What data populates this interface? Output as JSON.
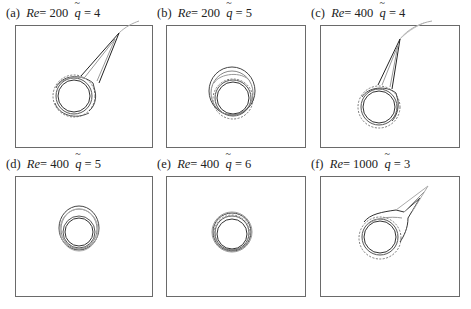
{
  "figure": {
    "panels": [
      {
        "id": "a",
        "label": "(a)",
        "re_symbol": "Re",
        "re_eq": "= 200",
        "q_symbol": "q",
        "q_eq": "= 4",
        "shape": "circle-with-long-tail"
      },
      {
        "id": "b",
        "label": "(b)",
        "re_symbol": "Re",
        "re_eq": "= 200",
        "q_symbol": "q",
        "q_eq": "= 5",
        "shape": "circle-with-upper-bulge"
      },
      {
        "id": "c",
        "label": "(c)",
        "re_symbol": "Re",
        "re_eq": "= 400",
        "q_symbol": "q",
        "q_eq": "= 4",
        "shape": "circle-with-long-tail"
      },
      {
        "id": "d",
        "label": "(d)",
        "re_symbol": "Re",
        "re_eq": "= 400",
        "q_symbol": "q",
        "q_eq": "= 5",
        "shape": "circle-with-small-bulge"
      },
      {
        "id": "e",
        "label": "(e)",
        "re_symbol": "Re",
        "re_eq": "= 400",
        "q_symbol": "q",
        "q_eq": "= 6",
        "shape": "concentric-circles"
      },
      {
        "id": "f",
        "label": "(f)",
        "re_symbol": "Re",
        "re_eq": "= 1000",
        "q_symbol": "q",
        "q_eq": "= 3",
        "shape": "circle-with-right-tail"
      }
    ],
    "colors": {
      "line": "#333333",
      "frame": "#6a6a6a",
      "light_line": "#9a9a9a"
    }
  }
}
